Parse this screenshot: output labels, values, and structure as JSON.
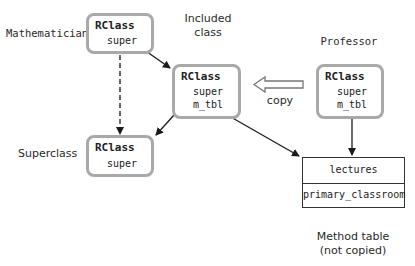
{
  "labels": {
    "mathematician": "Mathematician",
    "included_line1": "Included",
    "included_line2": "class",
    "professor": "Professor",
    "superclass": "Superclass",
    "copy": "copy",
    "method_table_line1": "Method table",
    "method_table_line2": "(not copied)"
  },
  "boxes": {
    "mathematician": {
      "title": "RClass",
      "fields": [
        "super"
      ]
    },
    "included": {
      "title": "RClass",
      "fields": [
        "super",
        "m_tbl"
      ]
    },
    "professor": {
      "title": "RClass",
      "fields": [
        "super",
        "m_tbl"
      ]
    },
    "superclass": {
      "title": "RClass",
      "fields": [
        "super"
      ]
    }
  },
  "method_table": {
    "rows": [
      "lectures",
      "primary_classroom"
    ]
  },
  "colors": {
    "box_border": "#a9a9a9",
    "arrow": "#1a1a1a",
    "table_border": "#333333"
  }
}
